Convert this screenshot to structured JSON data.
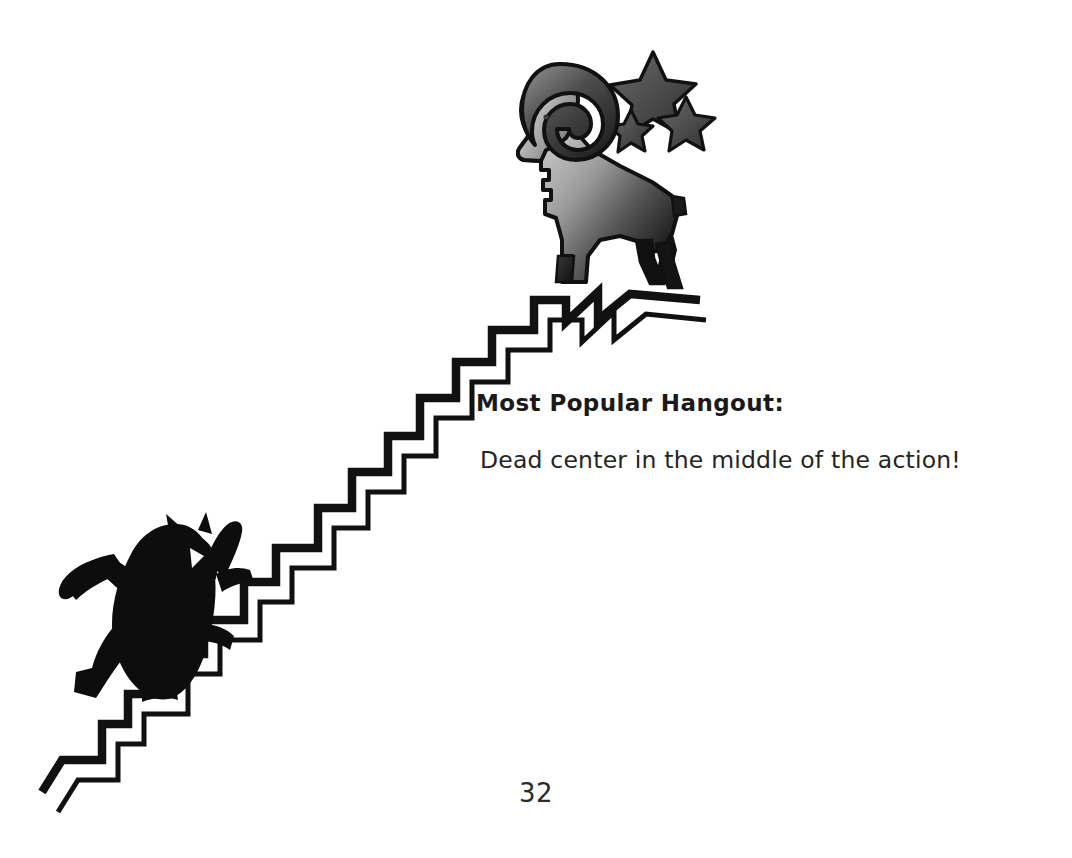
{
  "page": {
    "number": "32",
    "background_color": "#ffffff",
    "width": 1072,
    "height": 858
  },
  "caption": {
    "heading": "Most Popular Hangout:",
    "body": "Dead center in the middle of the action!",
    "heading_color": "#1a1a1a",
    "body_color": "#242424"
  },
  "illustration": {
    "title": "ram-on-ridge-with-climbing-cat",
    "elements": [
      "ram-icon",
      "stars-icon",
      "ridge-path",
      "cat-icon"
    ],
    "colors": {
      "ink": "#111111",
      "ram_gradient_light": "#cfcfcf",
      "ram_gradient_dark": "#1c1c1c",
      "star_fill": "#4a4a4a",
      "cat_fill": "#0d0d0d"
    }
  }
}
